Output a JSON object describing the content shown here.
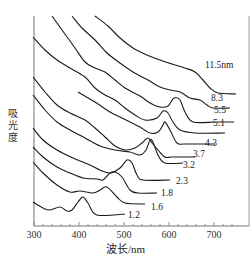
{
  "chart_data": {
    "type": "line",
    "title": "",
    "xlabel": "波长/nm",
    "ylabel": "吸光度",
    "xlim": [
      300,
      750
    ],
    "x_ticks": [
      300,
      400,
      500,
      600,
      700
    ],
    "y_ticks": [],
    "grid": false,
    "legend": "inline labels at right end of each curve",
    "series": [
      {
        "name": "1.2",
        "label": "1.2",
        "peak_nm": 410,
        "points": [
          [
            33,
            202
          ],
          [
            43,
            208
          ],
          [
            50,
            210
          ],
          [
            60,
            207
          ],
          [
            67,
            211
          ],
          [
            72,
            210
          ],
          [
            78,
            202
          ],
          [
            83,
            197
          ],
          [
            88,
            203
          ],
          [
            97,
            215
          ],
          [
            125,
            214
          ]
        ],
        "label_pos": [
          128,
          218
        ]
      },
      {
        "name": "1.6",
        "label": "1.6",
        "peak_nm": 460,
        "points": [
          [
            33,
            162
          ],
          [
            43,
            173
          ],
          [
            57,
            185
          ],
          [
            70,
            192
          ],
          [
            80,
            191
          ],
          [
            93,
            193
          ],
          [
            100,
            190
          ],
          [
            107,
            187
          ],
          [
            117,
            197
          ],
          [
            125,
            203
          ],
          [
            145,
            204
          ]
        ],
        "label_pos": [
          151,
          210
        ]
      },
      {
        "name": "1.8",
        "label": "1.8",
        "peak_nm": 475,
        "points": [
          [
            33,
            147
          ],
          [
            43,
            157
          ],
          [
            57,
            167
          ],
          [
            70,
            173
          ],
          [
            83,
            178
          ],
          [
            97,
            179
          ],
          [
            103,
            180
          ],
          [
            110,
            173
          ],
          [
            115,
            172
          ],
          [
            122,
            177
          ],
          [
            130,
            190
          ],
          [
            138,
            193
          ],
          [
            157,
            193
          ]
        ],
        "label_pos": [
          161,
          196
        ]
      },
      {
        "name": "2.3",
        "label": "2.3",
        "peak_nm": 505,
        "points": [
          [
            33,
            128
          ],
          [
            43,
            140
          ],
          [
            57,
            150
          ],
          [
            73,
            158
          ],
          [
            90,
            165
          ],
          [
            100,
            170
          ],
          [
            110,
            173
          ],
          [
            120,
            168
          ],
          [
            127,
            160
          ],
          [
            132,
            163
          ],
          [
            137,
            175
          ],
          [
            143,
            180
          ],
          [
            170,
            180
          ]
        ],
        "label_pos": [
          176,
          184
        ]
      },
      {
        "name": "3.2",
        "label": "3.2",
        "peak_nm": 545,
        "points": [
          [
            33,
            95
          ],
          [
            45,
            110
          ],
          [
            57,
            122
          ],
          [
            70,
            130
          ],
          [
            85,
            138
          ],
          [
            100,
            146
          ],
          [
            115,
            150
          ],
          [
            130,
            152
          ],
          [
            140,
            155
          ],
          [
            146,
            150
          ],
          [
            150,
            140
          ],
          [
            153,
            142
          ],
          [
            158,
            155
          ],
          [
            165,
            163
          ],
          [
            183,
            163
          ]
        ],
        "label_pos": [
          183,
          168
        ]
      },
      {
        "name": "3.7",
        "label": "3.7",
        "peak_nm": 555,
        "points": [
          [
            33,
            77
          ],
          [
            45,
            92
          ],
          [
            57,
            105
          ],
          [
            70,
            113
          ],
          [
            85,
            120
          ],
          [
            95,
            128
          ],
          [
            105,
            137
          ],
          [
            115,
            146
          ],
          [
            125,
            150
          ],
          [
            135,
            148
          ],
          [
            142,
            143
          ],
          [
            148,
            138
          ],
          [
            152,
            143
          ],
          [
            158,
            150
          ],
          [
            165,
            157
          ],
          [
            172,
            157
          ],
          [
            195,
            157
          ]
        ],
        "label_pos": [
          193,
          157
        ]
      },
      {
        "name": "4.3",
        "label": "4.3",
        "peak_nm": 590,
        "points": [
          [
            78,
            92
          ],
          [
            95,
            102
          ],
          [
            110,
            112
          ],
          [
            122,
            118
          ],
          [
            132,
            123
          ],
          [
            140,
            127
          ],
          [
            150,
            133
          ],
          [
            158,
            132
          ],
          [
            163,
            125
          ],
          [
            165,
            122
          ],
          [
            170,
            130
          ],
          [
            177,
            143
          ],
          [
            185,
            144
          ],
          [
            215,
            144
          ]
        ],
        "label_pos": [
          205,
          146
        ]
      },
      {
        "name": "5.1",
        "label": "5.1",
        "peak_nm": 605,
        "points": [
          [
            33,
            37
          ],
          [
            45,
            50
          ],
          [
            57,
            60
          ],
          [
            70,
            68
          ],
          [
            85,
            77
          ],
          [
            95,
            88
          ],
          [
            105,
            95
          ],
          [
            115,
            100
          ],
          [
            125,
            108
          ],
          [
            135,
            115
          ],
          [
            145,
            120
          ],
          [
            157,
            118
          ],
          [
            163,
            111
          ],
          [
            168,
            113
          ],
          [
            173,
            122
          ],
          [
            180,
            130
          ],
          [
            195,
            133
          ],
          [
            225,
            133
          ]
        ],
        "label_pos": [
          213,
          126
        ]
      },
      {
        "name": "5.5",
        "label": "5.5",
        "peak_nm": 628,
        "points": [
          [
            52,
            16
          ],
          [
            62,
            30
          ],
          [
            75,
            48
          ],
          [
            85,
            62
          ],
          [
            95,
            68
          ],
          [
            105,
            72
          ],
          [
            115,
            80
          ],
          [
            125,
            88
          ],
          [
            140,
            96
          ],
          [
            150,
            103
          ],
          [
            160,
            107
          ],
          [
            168,
            106
          ],
          [
            174,
            98
          ],
          [
            180,
            100
          ],
          [
            185,
            112
          ],
          [
            193,
            122
          ],
          [
            215,
            122
          ],
          [
            234,
            122
          ]
        ],
        "label_pos": [
          214,
          113
        ]
      },
      {
        "name": "8.3",
        "label": "8.3",
        "peak_nm": 640,
        "points": [
          [
            72,
            16
          ],
          [
            82,
            28
          ],
          [
            95,
            40
          ],
          [
            107,
            53
          ],
          [
            120,
            63
          ],
          [
            133,
            72
          ],
          [
            148,
            80
          ],
          [
            160,
            87
          ],
          [
            170,
            90
          ],
          [
            180,
            92
          ],
          [
            190,
            98
          ],
          [
            200,
            100
          ],
          [
            207,
            105
          ],
          [
            213,
            108
          ],
          [
            230,
            108
          ]
        ],
        "label_pos": [
          211,
          101
        ]
      },
      {
        "name": "11.5nm",
        "label": "11.5nm",
        "peak_nm": null,
        "points": [
          [
            95,
            16
          ],
          [
            108,
            26
          ],
          [
            120,
            38
          ],
          [
            133,
            48
          ],
          [
            147,
            55
          ],
          [
            160,
            60
          ],
          [
            172,
            64
          ],
          [
            185,
            68
          ],
          [
            195,
            72
          ],
          [
            203,
            80
          ],
          [
            210,
            88
          ],
          [
            218,
            93
          ],
          [
            236,
            94
          ]
        ],
        "label_pos": [
          205,
          68
        ]
      }
    ]
  },
  "axes": {
    "x_tick_labels": [
      "300",
      "400",
      "500",
      "600",
      "700"
    ],
    "xlabel": "波长/nm",
    "ylabel": "吸光度"
  }
}
